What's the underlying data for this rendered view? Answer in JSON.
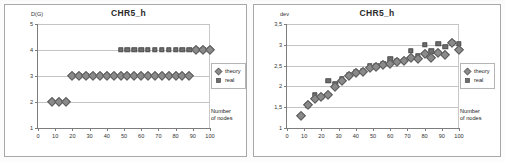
{
  "page": {
    "background": "#fdfdfd"
  },
  "charts": [
    {
      "id": "chart-left",
      "title": "CHR5_h",
      "ylabel": "D(G)",
      "xlabel_line1": "Number",
      "xlabel_line2": "of nodes",
      "legend": [
        {
          "label": "theory",
          "marker": "diamond",
          "color": "#8a8a8a"
        },
        {
          "label": "real",
          "marker": "square",
          "color": "#6e6e6e"
        }
      ],
      "chart_data": {
        "type": "scatter",
        "title": "CHR5_h",
        "xlabel": "Number of nodes",
        "ylabel": "D(G)",
        "xlim": [
          0,
          100
        ],
        "ylim": [
          1,
          5
        ],
        "xticks": [
          0,
          10,
          20,
          30,
          40,
          50,
          60,
          70,
          80,
          90,
          100
        ],
        "yticks": [
          1,
          2,
          3,
          4,
          5
        ],
        "ytick_labels": [
          "1",
          "2",
          "3",
          "4",
          "5"
        ],
        "grid": true,
        "legend_position": "right-outside",
        "series": [
          {
            "name": "theory",
            "marker": "diamond",
            "x": [
              8,
              12,
              16,
              20,
              24,
              28,
              32,
              36,
              40,
              44,
              48,
              52,
              56,
              60,
              64,
              68,
              72,
              76,
              80,
              84,
              88,
              92,
              96,
              100
            ],
            "y": [
              2,
              2,
              2,
              3,
              3,
              3,
              3,
              3,
              3,
              3,
              3,
              3,
              3,
              3,
              3,
              3,
              3,
              3,
              3,
              3,
              3,
              4,
              4,
              4
            ]
          },
          {
            "name": "real",
            "marker": "square",
            "x": [
              20,
              24,
              28,
              32,
              36,
              40,
              44,
              48,
              52,
              56,
              60,
              64,
              68,
              72,
              76,
              80,
              84,
              88,
              92,
              96,
              100
            ],
            "y": [
              3,
              3,
              3,
              3,
              3,
              3,
              3,
              4,
              4,
              4,
              4,
              4,
              4,
              4,
              4,
              4,
              4,
              4,
              4,
              4,
              4
            ]
          }
        ]
      }
    },
    {
      "id": "chart-right",
      "title": "CHR5_h",
      "ylabel": "dev",
      "xlabel_line1": "Number",
      "xlabel_line2": "of nodes",
      "legend": [
        {
          "label": "theory",
          "marker": "diamond",
          "color": "#8a8a8a"
        },
        {
          "label": "real",
          "marker": "square",
          "color": "#6e6e6e"
        }
      ],
      "chart_data": {
        "type": "scatter",
        "title": "CHR5_h",
        "xlabel": "Number of nodes",
        "ylabel": "dev",
        "xlim": [
          0,
          100
        ],
        "ylim": [
          1,
          3.5
        ],
        "xticks": [
          0,
          10,
          20,
          30,
          40,
          50,
          60,
          70,
          80,
          90,
          100
        ],
        "yticks": [
          1,
          1.5,
          2,
          2.5,
          3,
          3.5
        ],
        "ytick_labels": [
          "1",
          "1,5",
          "2",
          "2,5",
          "3",
          "3,5"
        ],
        "grid": true,
        "legend_position": "right-outside",
        "series": [
          {
            "name": "theory",
            "marker": "diamond",
            "x": [
              8,
              12,
              16,
              20,
              24,
              28,
              32,
              36,
              40,
              44,
              48,
              52,
              56,
              60,
              64,
              68,
              72,
              76,
              80,
              84,
              88,
              92,
              96,
              100
            ],
            "y": [
              1.3,
              1.55,
              1.7,
              1.75,
              1.8,
              1.98,
              2.13,
              2.25,
              2.32,
              2.35,
              2.45,
              2.47,
              2.52,
              2.55,
              2.58,
              2.6,
              2.68,
              2.65,
              2.78,
              2.68,
              2.8,
              2.76,
              3.05,
              2.88
            ]
          },
          {
            "name": "real",
            "marker": "square",
            "x": [
              12,
              16,
              20,
              24,
              28,
              32,
              36,
              40,
              44,
              48,
              52,
              56,
              60,
              64,
              68,
              72,
              76,
              80,
              84,
              88,
              92,
              96,
              100
            ],
            "y": [
              1.55,
              1.8,
              1.75,
              2.13,
              2.05,
              2.18,
              2.28,
              2.35,
              2.38,
              2.5,
              2.48,
              2.55,
              2.65,
              2.62,
              2.62,
              2.86,
              2.72,
              3.0,
              2.84,
              3.02,
              2.95,
              3.05,
              3.02
            ]
          }
        ]
      }
    }
  ]
}
